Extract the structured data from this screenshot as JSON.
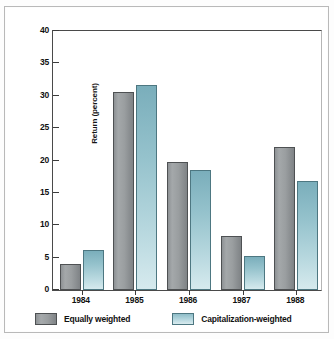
{
  "chart_data": {
    "type": "bar",
    "title": "",
    "xlabel": "",
    "ylabel": "Return (percent)",
    "ylim": [
      0,
      40
    ],
    "ytick_step": 5,
    "yticks": [
      "0",
      "5",
      "10",
      "15",
      "20",
      "25",
      "30",
      "35",
      "40"
    ],
    "categories": [
      "1984",
      "1985",
      "1986",
      "1987",
      "1988"
    ],
    "grid": false,
    "legend_position": "bottom-left",
    "series": [
      {
        "name": "Equally weighted",
        "color": "#9a9ea0",
        "values": [
          4.0,
          30.6,
          19.7,
          8.3,
          22.1
        ]
      },
      {
        "name": "Capitalization-weighted",
        "color": "#a8cfd8",
        "values": [
          6.2,
          31.7,
          18.6,
          5.3,
          16.8
        ]
      }
    ]
  }
}
